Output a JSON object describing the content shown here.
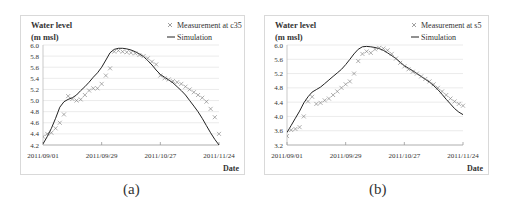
{
  "chart_data": [
    {
      "type": "line",
      "panel_label": "(a)",
      "ylabel_line1": "Water level",
      "ylabel_line2": "(m msl)",
      "xlabel": "Date",
      "ylim": [
        4.2,
        6.0
      ],
      "yticks": [
        "6.0",
        "5.8",
        "5.6",
        "5.4",
        "5.2",
        "5.0",
        "4.8",
        "4.6",
        "4.4",
        "4.2"
      ],
      "xticks": [
        "2011/09/01",
        "2011/09/29",
        "2011/10/27",
        "2011/11/24"
      ],
      "grid": "horizontal",
      "legend_position": "top-right",
      "series": [
        {
          "name": "Measurement at c35",
          "marker": "x",
          "x_days": [
            0,
            2,
            4,
            6,
            8,
            10,
            12,
            14,
            16,
            18,
            20,
            22,
            24,
            26,
            28,
            30,
            32,
            34,
            36,
            38,
            40,
            42,
            44,
            46,
            48,
            50,
            52,
            54,
            56,
            58,
            60,
            62,
            64,
            66,
            68,
            70,
            72,
            74,
            76,
            78,
            80,
            82,
            84
          ],
          "values": [
            4.35,
            4.4,
            4.42,
            4.5,
            4.6,
            4.75,
            5.08,
            5.03,
            5.0,
            5.02,
            5.1,
            5.18,
            5.22,
            5.22,
            5.3,
            5.45,
            5.58,
            5.88,
            5.9,
            5.88,
            5.87,
            5.86,
            5.85,
            5.82,
            5.8,
            5.76,
            5.7,
            5.65,
            5.45,
            5.4,
            5.38,
            5.35,
            5.33,
            5.3,
            5.25,
            5.2,
            5.15,
            5.1,
            5.05,
            4.98,
            4.85,
            4.7,
            4.4
          ]
        },
        {
          "name": "Simulation",
          "marker": "line",
          "x_days": [
            0,
            2,
            4,
            6,
            8,
            10,
            12,
            14,
            16,
            18,
            20,
            22,
            24,
            26,
            28,
            30,
            32,
            34,
            36,
            38,
            40,
            42,
            44,
            46,
            48,
            50,
            52,
            54,
            56,
            58,
            60,
            62,
            64,
            66,
            68,
            70,
            72,
            74,
            76,
            78,
            80,
            82,
            84
          ],
          "values": [
            4.22,
            4.35,
            4.5,
            4.68,
            4.88,
            4.98,
            5.02,
            5.05,
            5.1,
            5.18,
            5.25,
            5.33,
            5.42,
            5.5,
            5.6,
            5.73,
            5.86,
            5.92,
            5.94,
            5.94,
            5.93,
            5.91,
            5.88,
            5.84,
            5.79,
            5.72,
            5.64,
            5.55,
            5.47,
            5.42,
            5.37,
            5.32,
            5.25,
            5.18,
            5.1,
            5.0,
            4.9,
            4.8,
            4.68,
            4.55,
            4.42,
            4.3,
            4.2
          ]
        }
      ]
    },
    {
      "type": "line",
      "panel_label": "(b)",
      "ylabel_line1": "Water level",
      "ylabel_line2": "(m msl)",
      "xlabel": "Date",
      "ylim": [
        3.2,
        6.0
      ],
      "yticks": [
        "6.0",
        "5.6",
        "5.2",
        "4.8",
        "4.4",
        "4.0",
        "3.6",
        "3.2"
      ],
      "xticks": [
        "2011/09/01",
        "2011/09/29",
        "2011/10/27",
        "2011/11/24"
      ],
      "grid": "horizontal",
      "legend_position": "top-right",
      "series": [
        {
          "name": "Measurement at s5",
          "marker": "x",
          "x_days": [
            0,
            2,
            4,
            6,
            8,
            10,
            12,
            14,
            16,
            18,
            20,
            22,
            24,
            26,
            28,
            30,
            32,
            34,
            36,
            38,
            40,
            42,
            44,
            46,
            48,
            50,
            52,
            54,
            56,
            58,
            60,
            62,
            64,
            66,
            68,
            70,
            72,
            74,
            76,
            78,
            80,
            82,
            84
          ],
          "values": [
            3.45,
            3.62,
            3.65,
            3.7,
            4.0,
            4.42,
            4.55,
            4.35,
            4.38,
            4.45,
            4.5,
            4.6,
            4.7,
            4.8,
            4.9,
            4.98,
            5.2,
            5.55,
            5.75,
            5.82,
            5.78,
            5.88,
            5.92,
            5.9,
            5.85,
            5.75,
            5.62,
            5.5,
            5.4,
            5.32,
            5.25,
            5.2,
            5.12,
            5.05,
            4.98,
            4.9,
            4.8,
            4.7,
            4.6,
            4.5,
            4.42,
            4.35,
            4.3
          ]
        },
        {
          "name": "Simulation",
          "marker": "line",
          "x_days": [
            0,
            2,
            4,
            6,
            8,
            10,
            12,
            14,
            16,
            18,
            20,
            22,
            24,
            26,
            28,
            30,
            32,
            34,
            36,
            38,
            40,
            42,
            44,
            46,
            48,
            50,
            52,
            54,
            56,
            58,
            60,
            62,
            64,
            66,
            68,
            70,
            72,
            74,
            76,
            78,
            80,
            82,
            84
          ],
          "values": [
            3.55,
            3.75,
            3.95,
            4.15,
            4.38,
            4.55,
            4.68,
            4.75,
            4.82,
            4.92,
            5.02,
            5.12,
            5.22,
            5.32,
            5.45,
            5.6,
            5.75,
            5.88,
            5.95,
            5.96,
            5.95,
            5.93,
            5.9,
            5.85,
            5.78,
            5.7,
            5.62,
            5.52,
            5.42,
            5.35,
            5.28,
            5.2,
            5.12,
            5.04,
            4.96,
            4.86,
            4.75,
            4.62,
            4.48,
            4.35,
            4.22,
            4.12,
            4.05
          ]
        }
      ]
    }
  ]
}
